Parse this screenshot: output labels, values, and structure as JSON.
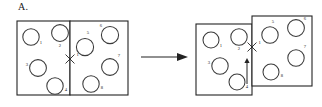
{
  "panel": {
    "label": "A."
  },
  "transition": {
    "arrow_icon": "right-arrow-icon",
    "direction": "right"
  },
  "colors": {
    "stroke": "#232323",
    "vesicle_stroke": "#3a3a3a",
    "background": "#ffffff",
    "text": "#1a1a1a"
  },
  "before_state": {
    "name": "before",
    "left_cell": {
      "label": "left-cell",
      "x": 17,
      "y": 21,
      "width": 53,
      "height": 74
    },
    "right_cell": {
      "label": "right-cell",
      "x": 70,
      "y": 21,
      "width": 58,
      "height": 74
    },
    "junction": {
      "label": "X",
      "annotation": "1",
      "x": 70,
      "y": 59
    },
    "vesicles": [
      {
        "label": "1",
        "cx": 31,
        "cy": 37,
        "r": 8.2,
        "lx": 41,
        "ly": 44
      },
      {
        "label": "2",
        "cx": 60,
        "cy": 33,
        "r": 8.4,
        "lx": 60,
        "ly": 47
      },
      {
        "label": "3",
        "cx": 38,
        "cy": 68,
        "r": 8.4,
        "lx": 27,
        "ly": 66
      },
      {
        "label": "4",
        "cx": 55,
        "cy": 86,
        "r": 8.2,
        "lx": 66,
        "ly": 91
      },
      {
        "label": "5",
        "cx": 85,
        "cy": 47,
        "r": 8.6,
        "lx": 88,
        "ly": 34
      },
      {
        "label": "6",
        "cx": 110,
        "cy": 35,
        "r": 8.6,
        "lx": 101,
        "ly": 27
      },
      {
        "label": "7",
        "cx": 110,
        "cy": 67,
        "r": 8.4,
        "lx": 119,
        "ly": 57
      },
      {
        "label": "8",
        "cx": 91,
        "cy": 84,
        "r": 8.2,
        "lx": 102,
        "ly": 89
      }
    ]
  },
  "after_state": {
    "name": "after",
    "left_cell": {
      "label": "left-cell",
      "x": 196,
      "y": 24,
      "width": 56,
      "height": 71
    },
    "right_cell": {
      "label": "right-cell-displaced",
      "x": 252,
      "y": 16,
      "width": 60,
      "height": 70
    },
    "junction": {
      "label": "X",
      "annotation": "1",
      "x": 252,
      "y": 47
    },
    "displacement_arrow": {
      "icon": "up-arrow-icon",
      "direction": "up",
      "x": 247,
      "y_top": 62,
      "y_bottom": 84
    },
    "vesicles": [
      {
        "label": "1",
        "cx": 211,
        "cy": 40,
        "r": 8.0,
        "lx": 221,
        "ly": 47
      },
      {
        "label": "2",
        "cx": 239,
        "cy": 37,
        "r": 8.2,
        "lx": 239,
        "ly": 50
      },
      {
        "label": "3",
        "cx": 220,
        "cy": 66,
        "r": 8.2,
        "lx": 209,
        "ly": 64
      },
      {
        "label": "4",
        "cx": 237,
        "cy": 82,
        "r": 8.0,
        "lx": 247,
        "ly": 88
      },
      {
        "label": "5",
        "cx": 270,
        "cy": 35,
        "r": 8.2,
        "lx": 273,
        "ly": 23
      },
      {
        "label": "6",
        "cx": 296,
        "cy": 28,
        "r": 8.4,
        "lx": 305,
        "ly": 20
      },
      {
        "label": "7",
        "cx": 296,
        "cy": 58,
        "r": 8.2,
        "lx": 305,
        "ly": 48
      },
      {
        "label": "8",
        "cx": 271,
        "cy": 72,
        "r": 8.0,
        "lx": 282,
        "ly": 77
      }
    ]
  }
}
